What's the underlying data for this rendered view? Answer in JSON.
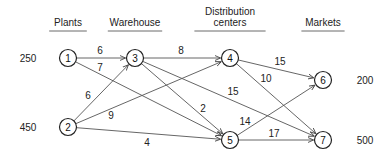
{
  "headers": [
    {
      "id": "plants",
      "lines": [
        "Plants"
      ],
      "x": 68,
      "y": 26
    },
    {
      "id": "warehouse",
      "lines": [
        "Warehouse"
      ],
      "x": 135,
      "y": 26
    },
    {
      "id": "distribution-centers",
      "lines": [
        "Distribution",
        "centers"
      ],
      "x": 230,
      "y": 15
    },
    {
      "id": "markets",
      "lines": [
        "Markets"
      ],
      "x": 323,
      "y": 26
    }
  ],
  "nodes": [
    {
      "id": "1",
      "label": "1",
      "x": 68,
      "y": 58
    },
    {
      "id": "2",
      "label": "2",
      "x": 68,
      "y": 127
    },
    {
      "id": "3",
      "label": "3",
      "x": 135,
      "y": 58
    },
    {
      "id": "4",
      "label": "4",
      "x": 230,
      "y": 58
    },
    {
      "id": "5",
      "label": "5",
      "x": 230,
      "y": 140
    },
    {
      "id": "6",
      "label": "6",
      "x": 323,
      "y": 80
    },
    {
      "id": "7",
      "label": "7",
      "x": 323,
      "y": 140
    }
  ],
  "quantities": [
    {
      "node": "1",
      "value": "250",
      "x": 28,
      "y": 58
    },
    {
      "node": "2",
      "value": "450",
      "x": 28,
      "y": 127
    },
    {
      "node": "6",
      "value": "200",
      "x": 365,
      "y": 80
    },
    {
      "node": "7",
      "value": "500",
      "x": 365,
      "y": 140
    }
  ],
  "edges": [
    {
      "from": "1",
      "to": "3",
      "cost": "6",
      "lx": 100,
      "ly": 50
    },
    {
      "from": "1",
      "to": "5",
      "cost": "7",
      "lx": 100,
      "ly": 67
    },
    {
      "from": "2",
      "to": "3",
      "cost": "6",
      "lx": 88,
      "ly": 95
    },
    {
      "from": "2",
      "to": "4",
      "cost": "9",
      "lx": 111,
      "ly": 115
    },
    {
      "from": "2",
      "to": "5",
      "cost": "4",
      "lx": 147,
      "ly": 142
    },
    {
      "from": "3",
      "to": "4",
      "cost": "8",
      "lx": 181,
      "ly": 50
    },
    {
      "from": "3",
      "to": "5",
      "cost": "2",
      "lx": 203,
      "ly": 108
    },
    {
      "from": "3",
      "to": "7",
      "cost": "15",
      "lx": 233,
      "ly": 91
    },
    {
      "from": "4",
      "to": "6",
      "cost": "15",
      "lx": 280,
      "ly": 61
    },
    {
      "from": "4",
      "to": "7",
      "cost": "10",
      "lx": 266,
      "ly": 78
    },
    {
      "from": "5",
      "to": "6",
      "cost": "14",
      "lx": 245,
      "ly": 121
    },
    {
      "from": "5",
      "to": "7",
      "cost": "17",
      "lx": 274,
      "ly": 133
    }
  ]
}
